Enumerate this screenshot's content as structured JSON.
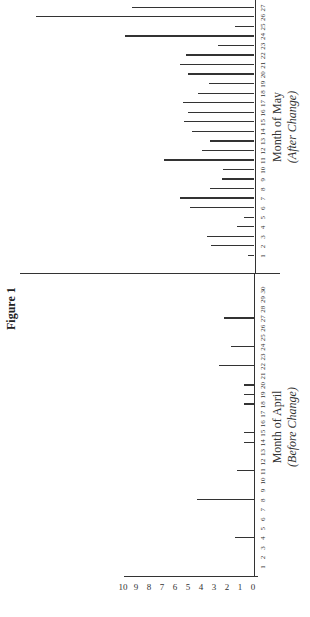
{
  "title": "Figure 1",
  "chart_data": {
    "type": "bar",
    "title": "Figure 1",
    "xlabel": "",
    "ylabel": "",
    "ylim": [
      0,
      10
    ],
    "y_ticks": [
      "0",
      "1",
      "2",
      "3",
      "4",
      "5",
      "6",
      "7",
      "8",
      "9",
      "10"
    ],
    "grid": false,
    "orientation_note": "page rotated 90 degrees counter-clockwise",
    "series": [
      {
        "name": "Month of April (Before Change)",
        "x": [
          1,
          2,
          3,
          4,
          5,
          6,
          7,
          8,
          9,
          10,
          11,
          12,
          13,
          14,
          15,
          16,
          17,
          18,
          19,
          20,
          21,
          22,
          23,
          24,
          25,
          26,
          27,
          28,
          29,
          30
        ],
        "values": [
          0,
          0,
          0,
          1.5,
          0,
          0,
          0,
          4.4,
          0,
          0,
          1.3,
          0,
          0,
          0.8,
          0.8,
          0,
          0,
          0.8,
          0.8,
          0.8,
          0,
          2.7,
          0,
          1.8,
          0,
          0,
          2.3,
          0,
          0,
          0
        ]
      },
      {
        "name": "Month of May (After Change)",
        "x": [
          1,
          2,
          3,
          4,
          5,
          6,
          7,
          8,
          9,
          10,
          11,
          12,
          13,
          14,
          15,
          16,
          17,
          18,
          19,
          20,
          21,
          22,
          23,
          24,
          25,
          26,
          27
        ],
        "values": [
          0.5,
          3.3,
          3.6,
          1.3,
          0.8,
          4.9,
          5.7,
          3.4,
          2.5,
          2.4,
          6.9,
          4.0,
          3.4,
          4.8,
          5.4,
          5.1,
          5.5,
          4.3,
          3.5,
          5.1,
          5.7,
          5.2,
          2.8,
          9.9,
          1.5,
          16.8,
          9.4
        ]
      }
    ]
  },
  "labels": {
    "april_title": "Month of April",
    "april_sub": "(Before Change)",
    "may_title": "Month of May",
    "may_sub": "(After Change)"
  }
}
